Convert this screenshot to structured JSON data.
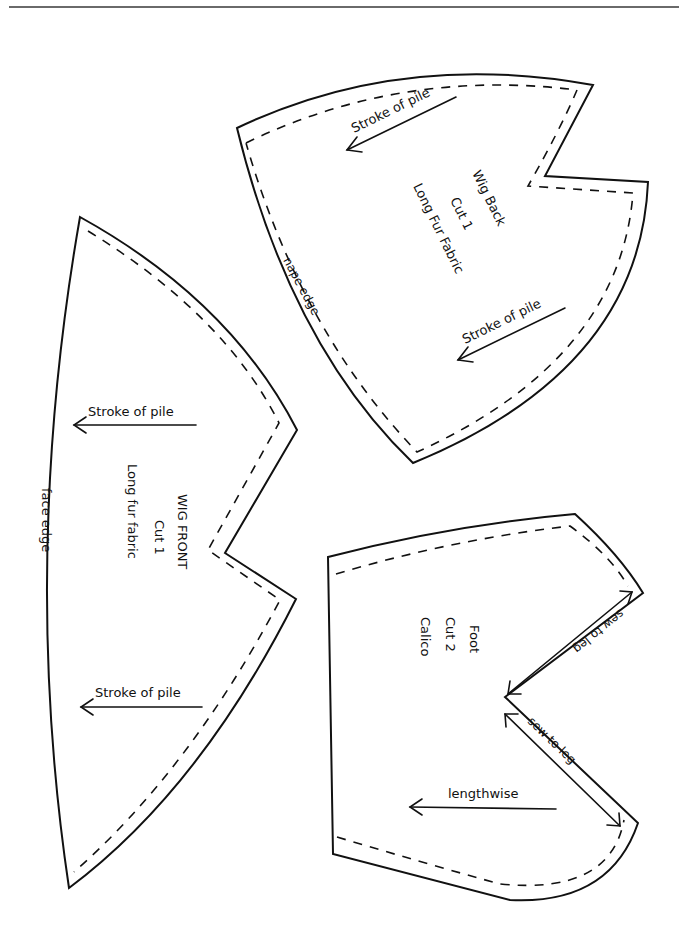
{
  "page": {
    "type": "sewing pattern sheet",
    "colors": {
      "ink": "#111111",
      "background": "#ffffff",
      "rule": "#6a6a6a"
    }
  },
  "pieces": {
    "wig_back": {
      "title": "Wig Back",
      "cut": "Cut 1",
      "fabric": "Long Fur Fabric",
      "edge_label": "nape edge",
      "arrows": [
        "Stroke of pile",
        "Stroke of pile"
      ]
    },
    "wig_front": {
      "title": "WIG FRONT",
      "cut": "Cut 1",
      "fabric": "Long fur fabric",
      "edge_label": "face edge",
      "arrows": [
        "Stroke of pile",
        "Stroke of pile"
      ]
    },
    "foot": {
      "title": "Foot",
      "cut": "Cut 2",
      "fabric": "Calico",
      "edge_labels": [
        "sew to leg",
        "sew to leg"
      ],
      "grain_label": "lengthwise"
    }
  }
}
